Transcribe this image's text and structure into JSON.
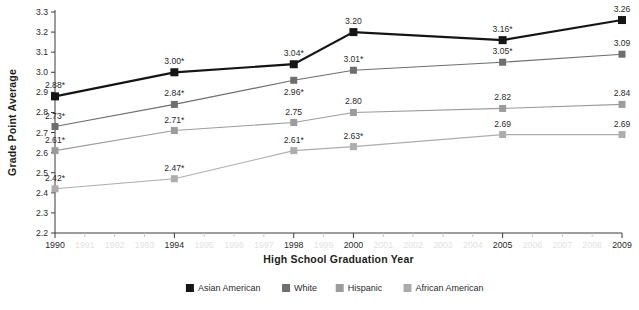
{
  "chart_data": {
    "type": "line",
    "title": "",
    "xlabel": "High School Graduation Year",
    "ylabel": "Grade Point Average",
    "x": [
      1990,
      1994,
      1998,
      2000,
      2005,
      2009
    ],
    "xlim": [
      1990,
      2009
    ],
    "ylim": [
      2.2,
      3.3
    ],
    "yticks": [
      "2.2",
      "2.3",
      "2.4",
      "2.5",
      "2.6",
      "2.7",
      "2.8",
      "2.9",
      "3.0",
      "3.1",
      "3.2",
      "3.3"
    ],
    "xticks_all": [
      "1990",
      "1991",
      "1992",
      "1993",
      "1994",
      "1995",
      "1996",
      "1997",
      "1998",
      "1999",
      "2000",
      "2001",
      "2002",
      "2003",
      "2004",
      "2005",
      "2006",
      "2007",
      "2008",
      "2009"
    ],
    "xticks_major": [
      "1990",
      "1994",
      "1998",
      "2000",
      "2005",
      "2009"
    ],
    "grid": false,
    "legend_position": "bottom",
    "series": [
      {
        "name": "Asian American",
        "color": "#151515",
        "values": [
          2.88,
          3.0,
          3.04,
          3.2,
          3.16,
          3.26
        ],
        "labels": [
          "2.88*",
          "3.00*",
          "3.04*",
          "3.20",
          "3.16*",
          "3.26"
        ],
        "label_side": [
          "above",
          "above",
          "above",
          "above",
          "above",
          "above"
        ]
      },
      {
        "name": "White",
        "color": "#6e6e6e",
        "values": [
          2.73,
          2.84,
          2.96,
          3.01,
          3.05,
          3.09
        ],
        "labels": [
          "2.73*",
          "2.84*",
          "2.96*",
          "3.01*",
          "3.05*",
          "3.09"
        ],
        "label_side": [
          "above",
          "above",
          "below",
          "above",
          "above",
          "above"
        ]
      },
      {
        "name": "Hispanic",
        "color": "#9c9c9c",
        "values": [
          2.61,
          2.71,
          2.75,
          2.8,
          2.82,
          2.84
        ],
        "labels": [
          "2.61*",
          "2.71*",
          "2.75",
          "2.80",
          "2.82",
          "2.84"
        ],
        "label_side": [
          "above",
          "above",
          "above",
          "above",
          "above",
          "above"
        ]
      },
      {
        "name": "African American",
        "color": "#adadad",
        "values": [
          2.42,
          2.47,
          2.61,
          2.63,
          2.69,
          2.69
        ],
        "labels": [
          "2.42*",
          "2.47*",
          "2.61*",
          "2.63*",
          "2.69",
          "2.69"
        ],
        "label_side": [
          "above",
          "above",
          "above",
          "above",
          "above",
          "above"
        ]
      }
    ]
  },
  "legend": {
    "items": [
      {
        "label": "Asian American",
        "color": "#151515"
      },
      {
        "label": "White",
        "color": "#6e6e6e"
      },
      {
        "label": "Hispanic",
        "color": "#9c9c9c"
      },
      {
        "label": "African American",
        "color": "#adadad"
      }
    ]
  }
}
